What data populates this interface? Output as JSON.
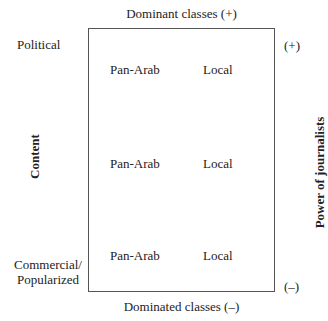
{
  "diagram": {
    "top_label": "Dominant classes (+)",
    "bottom_label": "Dominated classes (–)",
    "left_axis_label": "Content",
    "right_axis_label": "Power of journalists",
    "right_plus": "(+)",
    "right_minus": "(–)",
    "row_labels": [
      "Political",
      "Commercial/",
      "Popularized"
    ],
    "rows": [
      {
        "col1": "Pan-Arab",
        "col2": "Local"
      },
      {
        "col1": "Pan-Arab",
        "col2": "Local"
      },
      {
        "col1": "Pan-Arab",
        "col2": "Local"
      }
    ]
  }
}
